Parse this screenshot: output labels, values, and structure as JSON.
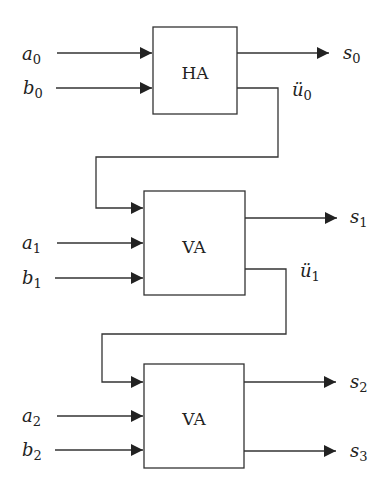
{
  "diagram": {
    "title": "",
    "blocks": [
      {
        "id": "ha",
        "label": "HA"
      },
      {
        "id": "va1",
        "label": "VA"
      },
      {
        "id": "va2",
        "label": "VA"
      }
    ],
    "inputs": [
      {
        "var": "a",
        "sub": "0"
      },
      {
        "var": "b",
        "sub": "0"
      },
      {
        "var": "a",
        "sub": "1"
      },
      {
        "var": "b",
        "sub": "1"
      },
      {
        "var": "a",
        "sub": "2"
      },
      {
        "var": "b",
        "sub": "2"
      }
    ],
    "outputs": [
      {
        "var": "s",
        "sub": "0"
      },
      {
        "var": "s",
        "sub": "1"
      },
      {
        "var": "s",
        "sub": "2"
      },
      {
        "var": "s",
        "sub": "3"
      }
    ],
    "carries": [
      {
        "var": "ü",
        "sub": "0"
      },
      {
        "var": "ü",
        "sub": "1"
      }
    ],
    "colors": {
      "line": "#333333",
      "arrowhead": "#222222",
      "background": "#ffffff"
    }
  }
}
